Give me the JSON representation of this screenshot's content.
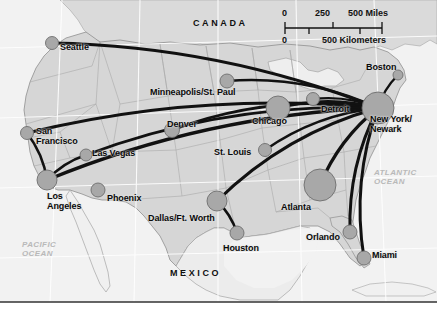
{
  "map": {
    "title": "Airline hub-and-spoke route map of the United States",
    "background_color": "#ffffff",
    "land_color": "#d6d6d6",
    "ocean_color": "#f2f2f2",
    "route_color": "#111111",
    "city_dot_color": "#a8a8a8",
    "border_color": "#9a9a9a",
    "graticule_color": "#ffffff"
  },
  "countries": [
    {
      "name": "canada",
      "label": "CANADA",
      "x": 193,
      "y": 18
    },
    {
      "name": "mexico",
      "label": "MEXICO",
      "x": 170,
      "y": 268
    }
  ],
  "oceans": [
    {
      "name": "pacific-ocean",
      "line1": "PACIFIC",
      "line2": "OCEAN",
      "x": 22,
      "y": 240
    },
    {
      "name": "atlantic-ocean",
      "line1": "ATLANTIC",
      "line2": "OCEAN",
      "x": 374,
      "y": 168
    }
  ],
  "scale": {
    "miles_ticks": [
      "0",
      "250",
      "500 Miles"
    ],
    "kilometers_ticks": [
      "0",
      "500 Kilometers"
    ],
    "miles_label": "500 Miles",
    "km_label": "500 Kilometers"
  },
  "cities": [
    {
      "name": "seattle",
      "label": "Seattle",
      "x": 52,
      "y": 43,
      "r": 6.5,
      "lx": 60,
      "ly": 43,
      "align": "left"
    },
    {
      "name": "san-francisco",
      "label": "San\nFrancisco",
      "x": 27,
      "y": 133,
      "r": 6.5,
      "lx": 36,
      "ly": 127,
      "align": "left"
    },
    {
      "name": "los-angeles",
      "label": "Los\nAngeles",
      "x": 47,
      "y": 180,
      "r": 10,
      "lx": 47,
      "ly": 192,
      "align": "left"
    },
    {
      "name": "las-vegas",
      "label": "Las Vegas",
      "x": 86,
      "y": 155,
      "r": 6,
      "lx": 92,
      "ly": 149,
      "align": "left"
    },
    {
      "name": "phoenix",
      "label": "Phoenix",
      "x": 98,
      "y": 190,
      "r": 7,
      "lx": 107,
      "ly": 194,
      "align": "left"
    },
    {
      "name": "denver",
      "label": "Denver",
      "x": 172,
      "y": 130,
      "r": 7.5,
      "lx": 167,
      "ly": 120,
      "align": "left"
    },
    {
      "name": "minneapolis-st-paul",
      "label": "Minneapolis/St. Paul",
      "x": 227,
      "y": 81,
      "r": 7,
      "lx": 150,
      "ly": 88,
      "align": "left"
    },
    {
      "name": "chicago",
      "label": "Chicago",
      "x": 278,
      "y": 108,
      "r": 12,
      "lx": 252,
      "ly": 117,
      "align": "left"
    },
    {
      "name": "detroit",
      "label": "Detroit",
      "x": 313,
      "y": 99,
      "r": 6.5,
      "lx": 321,
      "ly": 105,
      "align": "left"
    },
    {
      "name": "st-louis",
      "label": "St. Louis",
      "x": 265,
      "y": 150,
      "r": 6.5,
      "lx": 214,
      "ly": 148,
      "align": "left"
    },
    {
      "name": "boston",
      "label": "Boston",
      "x": 398,
      "y": 75,
      "r": 5,
      "lx": 366,
      "ly": 63,
      "align": "left"
    },
    {
      "name": "new-york-newark",
      "label": "New York/\nNewark",
      "x": 378,
      "y": 108,
      "r": 16,
      "lx": 370,
      "ly": 115,
      "align": "left"
    },
    {
      "name": "dallas-ft-worth",
      "label": "Dallas/Ft. Worth",
      "x": 217,
      "y": 201,
      "r": 10,
      "lx": 148,
      "ly": 214,
      "align": "left"
    },
    {
      "name": "houston",
      "label": "Houston",
      "x": 237,
      "y": 233,
      "r": 7,
      "lx": 223,
      "ly": 244,
      "align": "left"
    },
    {
      "name": "atlanta",
      "label": "Atlanta",
      "x": 320,
      "y": 185,
      "r": 16,
      "lx": 281,
      "ly": 203,
      "align": "left"
    },
    {
      "name": "orlando",
      "label": "Orlando",
      "x": 350,
      "y": 232,
      "r": 7,
      "lx": 306,
      "ly": 233,
      "align": "left"
    },
    {
      "name": "miami",
      "label": "Miami",
      "x": 364,
      "y": 258,
      "r": 7,
      "lx": 372,
      "ly": 251,
      "align": "left"
    }
  ],
  "routes": [
    {
      "name": "route-new-york-seattle",
      "from": "new-york-newark",
      "to": "seattle",
      "width": 3.0
    },
    {
      "name": "route-new-york-san-francisco",
      "from": "new-york-newark",
      "to": "san-francisco",
      "width": 3.0
    },
    {
      "name": "route-new-york-los-angeles",
      "from": "new-york-newark",
      "to": "los-angeles",
      "width": 3.4
    },
    {
      "name": "route-new-york-las-vegas",
      "from": "new-york-newark",
      "to": "las-vegas",
      "width": 2.6
    },
    {
      "name": "route-new-york-denver",
      "from": "new-york-newark",
      "to": "denver",
      "width": 2.6
    },
    {
      "name": "route-new-york-minneapolis",
      "from": "new-york-newark",
      "to": "minneapolis-st-paul",
      "width": 2.6
    },
    {
      "name": "route-new-york-chicago",
      "from": "new-york-newark",
      "to": "chicago",
      "width": 3.2
    },
    {
      "name": "route-new-york-detroit",
      "from": "new-york-newark",
      "to": "detroit",
      "width": 2.4
    },
    {
      "name": "route-new-york-st-louis",
      "from": "new-york-newark",
      "to": "st-louis",
      "width": 2.6
    },
    {
      "name": "route-new-york-boston",
      "from": "new-york-newark",
      "to": "boston",
      "width": 2.4
    },
    {
      "name": "route-new-york-dallas",
      "from": "new-york-newark",
      "to": "dallas-ft-worth",
      "width": 3.0
    },
    {
      "name": "route-new-york-atlanta",
      "from": "new-york-newark",
      "to": "atlanta",
      "width": 3.4
    },
    {
      "name": "route-new-york-orlando",
      "from": "new-york-newark",
      "to": "orlando",
      "width": 3.0
    },
    {
      "name": "route-new-york-miami",
      "from": "new-york-newark",
      "to": "miami",
      "width": 3.0
    },
    {
      "name": "route-los-angeles-las-vegas",
      "from": "los-angeles",
      "to": "las-vegas",
      "width": 2.6
    },
    {
      "name": "route-los-angeles-san-francisco",
      "from": "los-angeles",
      "to": "san-francisco",
      "width": 2.6
    },
    {
      "name": "route-dallas-houston",
      "from": "dallas-ft-worth",
      "to": "houston",
      "width": 2.6
    }
  ]
}
